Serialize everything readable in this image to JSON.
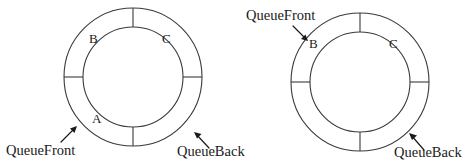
{
  "figure": {
    "background_color": "#ffffff",
    "line_color": "#3a3a3a",
    "text_color": "#1a1a1a"
  },
  "diagrams": [
    {
      "id": "left-queue",
      "name": "circular-queue-before",
      "center": {
        "x": 133,
        "y": 77
      },
      "outer_radius": 69,
      "inner_radius": 50,
      "spokes_degrees": [
        0,
        90,
        180,
        270
      ],
      "slots": [
        {
          "id": "slot-a",
          "label": "A",
          "x": 92,
          "y": 112
        },
        {
          "id": "slot-b",
          "label": "B",
          "x": 89,
          "y": 32
        },
        {
          "id": "slot-c",
          "label": "C",
          "x": 162,
          "y": 32
        }
      ],
      "pointers": [
        {
          "id": "queue-front",
          "label": "QueueFront",
          "label_x": 6,
          "label_y": 143,
          "arrow_from": {
            "x": 61,
            "y": 142
          },
          "arrow_to": {
            "x": 77,
            "y": 126
          }
        },
        {
          "id": "queue-back",
          "label": "QueueBack",
          "label_x": 177,
          "label_y": 144,
          "arrow_from": {
            "x": 209,
            "y": 148
          },
          "arrow_to": {
            "x": 194,
            "y": 132
          }
        }
      ]
    },
    {
      "id": "right-queue",
      "name": "circular-queue-after",
      "center": {
        "x": 360,
        "y": 82
      },
      "outer_radius": 69,
      "inner_radius": 50,
      "spokes_degrees": [
        0,
        90,
        180,
        270
      ],
      "slots": [
        {
          "id": "slot-b",
          "label": "B",
          "x": 309,
          "y": 37
        },
        {
          "id": "slot-c",
          "label": "C",
          "x": 389,
          "y": 37
        }
      ],
      "pointers": [
        {
          "id": "queue-front",
          "label": "QueueFront",
          "label_x": 246,
          "label_y": 8,
          "arrow_from": {
            "x": 293,
            "y": 26
          },
          "arrow_to": {
            "x": 308,
            "y": 41
          }
        },
        {
          "id": "queue-back",
          "label": "QueueBack",
          "label_x": 394,
          "label_y": 145,
          "arrow_from": {
            "x": 424,
            "y": 150
          },
          "arrow_to": {
            "x": 409,
            "y": 133
          }
        }
      ]
    }
  ]
}
